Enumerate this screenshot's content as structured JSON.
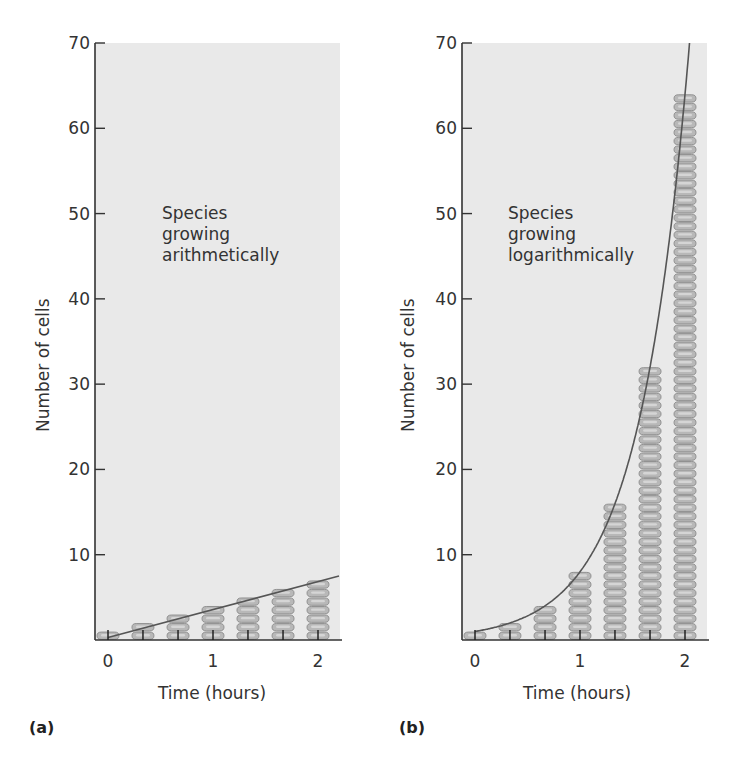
{
  "chart_data": [
    {
      "type": "bar",
      "panel_label": "(a)",
      "title": "",
      "annotation": [
        "Species",
        "growing",
        "arithmetically"
      ],
      "xlabel": "Time (hours)",
      "ylabel": "Number of cells",
      "x": [
        0,
        0.333,
        0.667,
        1,
        1.333,
        1.667,
        2
      ],
      "values": [
        1,
        2,
        3,
        4,
        5,
        6,
        7
      ],
      "x_ticks": [
        0,
        1,
        2
      ],
      "y_ticks": [
        10,
        20,
        30,
        40,
        50,
        60,
        70
      ],
      "ylim": [
        0,
        70
      ],
      "xlim": [
        0,
        2
      ],
      "trend_line": {
        "type": "linear",
        "from": [
          0,
          0.3
        ],
        "to": [
          2.2,
          7.5
        ]
      },
      "grid": false
    },
    {
      "type": "bar",
      "panel_label": "(b)",
      "title": "",
      "annotation": [
        "Species",
        "growing",
        "logarithmically"
      ],
      "xlabel": "Time (hours)",
      "ylabel": "Number of cells",
      "x": [
        0,
        0.333,
        0.667,
        1,
        1.333,
        1.667,
        2
      ],
      "values": [
        1,
        2,
        4,
        8,
        16,
        32,
        64
      ],
      "x_ticks": [
        0,
        1,
        2
      ],
      "y_ticks": [
        10,
        20,
        30,
        40,
        50,
        60,
        70
      ],
      "ylim": [
        0,
        70
      ],
      "xlim": [
        0,
        2
      ],
      "trend_line": {
        "type": "exponential",
        "formula": "2^(3t)"
      },
      "grid": false
    }
  ],
  "colors": {
    "plot_bg": "#e9e9e9",
    "axis": "#333333",
    "cell_fill": "#b8b8b8",
    "cell_edge": "#8a8a8a",
    "cell_highlight": "#d8d8d8",
    "curve": "#555555"
  }
}
